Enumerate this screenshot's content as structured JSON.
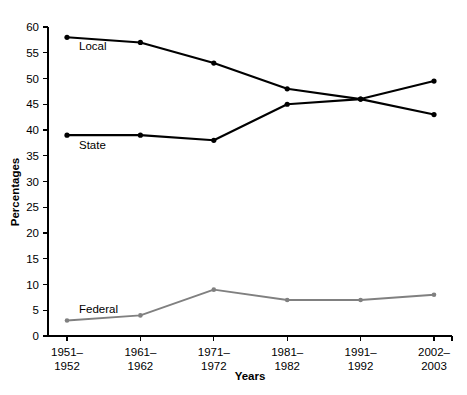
{
  "chart_data": {
    "type": "line",
    "title": "",
    "xlabel": "Years",
    "ylabel": "Percentages",
    "categories": [
      "1951–\n1952",
      "1961–\n1962",
      "1971–\n1972",
      "1981–\n1982",
      "1991–\n1992",
      "2002–\n2003"
    ],
    "category_lines": [
      [
        "1951–",
        "1952"
      ],
      [
        "1961–",
        "1962"
      ],
      [
        "1971–",
        "1972"
      ],
      [
        "1981–",
        "1982"
      ],
      [
        "1991–",
        "1992"
      ],
      [
        "2002–",
        "2003"
      ]
    ],
    "ylim": [
      0,
      60
    ],
    "yticks": [
      0,
      5,
      10,
      15,
      20,
      25,
      30,
      35,
      40,
      45,
      50,
      55,
      60
    ],
    "ytick_labels": [
      "0",
      "5",
      "10",
      "15",
      "20",
      "25",
      "30",
      "35",
      "40",
      "45",
      "50",
      "55",
      "60"
    ],
    "grid": false,
    "legend": "inline-labels",
    "series": [
      {
        "name": "Local",
        "color": "#000000",
        "values": [
          58,
          57,
          53,
          48,
          46,
          43
        ],
        "label_x_index": 0,
        "label_offset": {
          "dx": 12,
          "dy": 13
        }
      },
      {
        "name": "State",
        "color": "#000000",
        "values": [
          39,
          39,
          38,
          45,
          46,
          49.5
        ],
        "label_x_index": 0,
        "label_offset": {
          "dx": 12,
          "dy": 14
        }
      },
      {
        "name": "Federal",
        "color": "#808080",
        "values": [
          3,
          4,
          9,
          7,
          7,
          8
        ],
        "label_x_index": 0,
        "label_offset": {
          "dx": 12,
          "dy": -8
        }
      }
    ]
  }
}
